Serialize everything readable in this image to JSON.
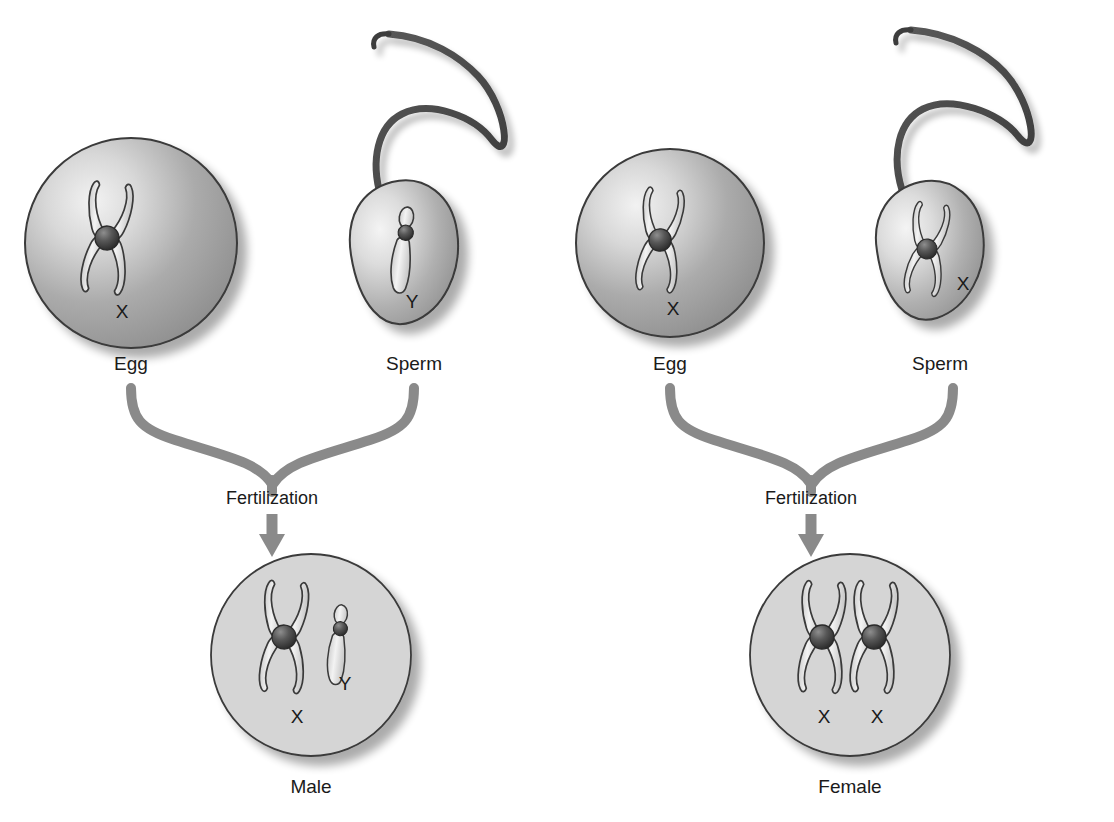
{
  "figure": {
    "topic": "sex-determination-diagram",
    "background_color": "#ffffff",
    "text_color": "#1a1a1a",
    "arrow_color": "#8a8a8a",
    "zygote_fill": "#d5d5d5",
    "outline_color": "#3a3a3a"
  },
  "pathways": [
    {
      "id": "male-pathway",
      "gametes": [
        {
          "id": "egg-left",
          "cell_type": "egg",
          "label": "Egg",
          "chromosome": "X",
          "chromosome_label": "X"
        },
        {
          "id": "sperm-left",
          "cell_type": "sperm",
          "label": "Sperm",
          "chromosome": "Y",
          "chromosome_label": "Y"
        }
      ],
      "process_label": "Fertilization",
      "zygote": {
        "id": "zygote-male",
        "label": "Male",
        "chromosomes": [
          "X",
          "Y"
        ],
        "chromosome_labels": [
          "X",
          "Y"
        ]
      }
    },
    {
      "id": "female-pathway",
      "gametes": [
        {
          "id": "egg-right",
          "cell_type": "egg",
          "label": "Egg",
          "chromosome": "X",
          "chromosome_label": "X"
        },
        {
          "id": "sperm-right",
          "cell_type": "sperm",
          "label": "Sperm",
          "chromosome": "X",
          "chromosome_label": "X"
        }
      ],
      "process_label": "Fertilization",
      "zygote": {
        "id": "zygote-female",
        "label": "Female",
        "chromosomes": [
          "X",
          "X"
        ],
        "chromosome_labels": [
          "X",
          "X"
        ]
      }
    }
  ]
}
